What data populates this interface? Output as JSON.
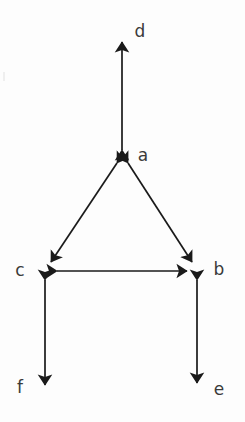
{
  "diagram": {
    "background_color": "#fdfdfd",
    "stroke_color": "#1a1a1a",
    "label_color": "#3a3a3a",
    "nodes": [
      {
        "id": "a",
        "label": "a",
        "x": 122,
        "y": 157,
        "label_x": 143,
        "label_y": 155
      },
      {
        "id": "b",
        "label": "b",
        "x": 197,
        "y": 271,
        "label_x": 219,
        "label_y": 269
      },
      {
        "id": "c",
        "label": "c",
        "x": 45,
        "y": 271,
        "label_x": 20,
        "label_y": 270
      },
      {
        "id": "d",
        "label": "d",
        "x": 122,
        "y": 35,
        "label_x": 140,
        "label_y": 31
      },
      {
        "id": "e",
        "label": "e",
        "x": 197,
        "y": 390,
        "label_x": 219,
        "label_y": 389
      },
      {
        "id": "f",
        "label": "f",
        "x": 45,
        "y": 392,
        "label_x": 20,
        "label_y": 387
      }
    ],
    "edges": [
      {
        "id": "edge-a-d",
        "from": "a",
        "to": "d",
        "arrows": "both",
        "x1": 122,
        "y1": 150,
        "x2": 122,
        "y2": 42
      },
      {
        "id": "edge-a-c",
        "from": "a",
        "to": "c",
        "arrows": "both",
        "x1": 117,
        "y1": 163,
        "x2": 51,
        "y2": 262
      },
      {
        "id": "edge-a-b",
        "from": "a",
        "to": "b",
        "arrows": "both",
        "x1": 128,
        "y1": 163,
        "x2": 192,
        "y2": 262
      },
      {
        "id": "edge-c-b",
        "from": "c",
        "to": "b",
        "arrows": "both",
        "x1": 57,
        "y1": 271,
        "x2": 187,
        "y2": 271
      },
      {
        "id": "edge-c-f",
        "from": "c",
        "to": "f",
        "arrows": "both",
        "x1": 45,
        "y1": 280,
        "x2": 45,
        "y2": 385
      },
      {
        "id": "edge-b-e",
        "from": "b",
        "to": "e",
        "arrows": "both",
        "x1": 197,
        "y1": 280,
        "x2": 197,
        "y2": 383
      }
    ]
  }
}
